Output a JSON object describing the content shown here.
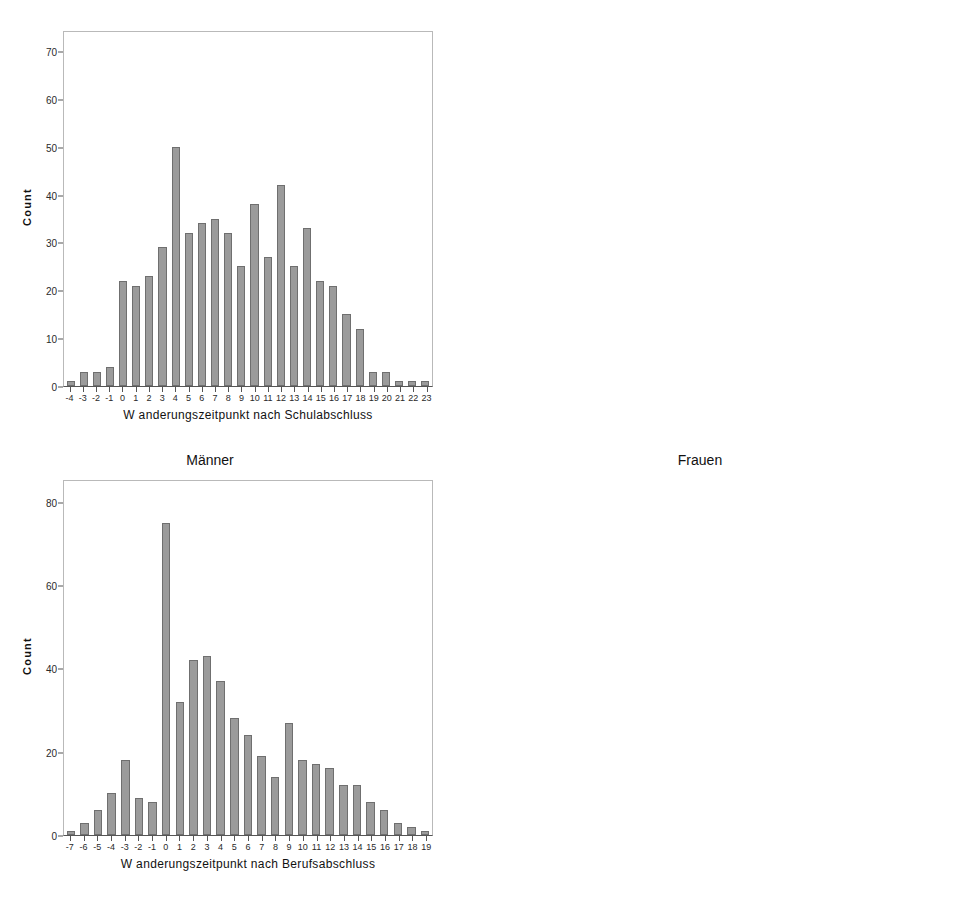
{
  "figure": {
    "background": "#ffffff",
    "bar_fill": "#9b9b9b",
    "bar_stroke": "#6f6f6f",
    "axis_color": "#555555",
    "frame_color": "#b9b9b9"
  },
  "group_titles": {
    "left": "Männer",
    "right": "Frauen"
  },
  "chart_data": [
    {
      "id": "maenner-schulabschluss",
      "type": "bar",
      "position": "top-left",
      "title": "",
      "xlabel": "W anderungszeitpunkt nach Schulabschluss",
      "ylabel": "Count",
      "unit_label": "",
      "ylim": [
        0,
        74
      ],
      "yticks": [
        0,
        10,
        20,
        30,
        40,
        50,
        60,
        70
      ],
      "grid": false,
      "legend": "none",
      "categories": [
        "-4",
        "-3",
        "-2",
        "-1",
        "0",
        "1",
        "2",
        "3",
        "4",
        "5",
        "6",
        "7",
        "8",
        "9",
        "10",
        "11",
        "12",
        "13",
        "14",
        "15",
        "16",
        "17",
        "18",
        "19",
        "20",
        "21",
        "22",
        "23"
      ],
      "values": [
        1,
        3,
        3,
        4,
        22,
        21,
        23,
        29,
        50,
        32,
        34,
        35,
        32,
        25,
        38,
        27,
        42,
        25,
        33,
        22,
        21,
        15,
        12,
        3,
        3,
        1,
        1,
        1
      ]
    },
    {
      "id": "frauen-schulabschluss",
      "type": "bar",
      "position": "top-right",
      "title": "",
      "xlabel": "W anderungszeitpunkt nach Schulabschluss",
      "ylabel": "Count",
      "unit_label": "Jahre",
      "ylim": [
        0,
        74
      ],
      "yticks": [
        0,
        10,
        20,
        30,
        40,
        50,
        60,
        70
      ],
      "grid": false,
      "legend": "none",
      "categories": [
        "-5",
        "-4",
        "-3",
        "-2",
        "-1",
        "0",
        "1",
        "2",
        "3",
        "4",
        "5",
        "6",
        "7",
        "8",
        "9",
        "10",
        "11",
        "12",
        "13",
        "14",
        "15",
        "16",
        "17",
        "18",
        "19",
        "20",
        "21"
      ],
      "values": [
        3,
        1,
        5,
        2,
        4,
        70,
        23,
        23,
        46,
        43,
        33,
        22,
        29,
        27,
        27,
        23,
        18,
        24,
        21,
        19,
        19,
        21,
        16,
        14,
        6,
        2,
        5
      ]
    },
    {
      "id": "maenner-berufsabschluss",
      "type": "bar",
      "position": "bottom-left",
      "title": "",
      "xlabel": "W anderungszeitpunkt nach Berufsabschluss",
      "ylabel": "Count",
      "unit_label": "",
      "ylim": [
        0,
        85
      ],
      "yticks": [
        0,
        20,
        40,
        60,
        80
      ],
      "grid": false,
      "legend": "none",
      "categories": [
        "-7",
        "-6",
        "-5",
        "-4",
        "-3",
        "-2",
        "-1",
        "0",
        "1",
        "2",
        "3",
        "4",
        "5",
        "6",
        "7",
        "8",
        "9",
        "10",
        "11",
        "12",
        "13",
        "14",
        "15",
        "16",
        "17",
        "18",
        "19"
      ],
      "values": [
        1,
        3,
        6,
        10,
        18,
        9,
        8,
        75,
        32,
        42,
        43,
        37,
        28,
        24,
        19,
        14,
        27,
        18,
        17,
        16,
        12,
        12,
        8,
        6,
        3,
        2,
        1
      ]
    },
    {
      "id": "frauen-berufsabschluss",
      "type": "bar",
      "position": "bottom-right",
      "title": "",
      "xlabel": "W anderungszeitpunkt nach Berufsabschluss",
      "ylabel": "Count",
      "unit_label": "Jahre",
      "ylim": [
        0,
        85
      ],
      "yticks": [
        0,
        20,
        40,
        60,
        80
      ],
      "grid": false,
      "legend": "none",
      "categories": [
        "-8",
        "-7",
        "-6",
        "-5",
        "-4",
        "-3",
        "-2",
        "-1",
        "0",
        "1",
        "2",
        "3",
        "4",
        "5",
        "6",
        "7",
        "8",
        "9",
        "10",
        "11",
        "12",
        "13",
        "14",
        "15",
        "16",
        "17"
      ],
      "values": [
        4,
        2,
        3,
        5,
        7,
        45,
        7,
        9,
        81,
        41,
        29,
        26,
        24,
        20,
        24,
        15,
        19,
        12,
        14,
        15,
        12,
        15,
        16,
        7,
        9,
        5
      ]
    }
  ]
}
